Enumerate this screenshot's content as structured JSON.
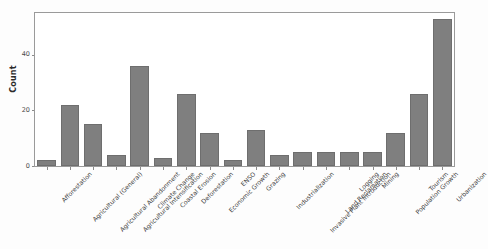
{
  "chart_data": {
    "type": "bar",
    "title": "",
    "xlabel": "",
    "ylabel": "Count",
    "ylim": [
      0,
      55
    ],
    "yticks": [
      0,
      20,
      40
    ],
    "ytick_labels": [
      "0",
      "20",
      "40"
    ],
    "grid": false,
    "legend": null,
    "bar_color": "#7f7f7f",
    "bar_edge_color": "#6e6e6e",
    "categories": [
      "Afforestation",
      "Agricultural (General)",
      "Agricultural Abandonment",
      "Agricultural Intensification",
      "Climate Change",
      "Coastal Erosion",
      "Deforestation",
      "Economic Growth",
      "ENSO",
      "Grazing",
      "Industrialization",
      "Invasive Plant Introduction",
      "Land Reclamation",
      "Logging",
      "Mining",
      "Population Growth",
      "Tourism",
      "Urbanization"
    ],
    "values": [
      2,
      22,
      15,
      4,
      36,
      3,
      26,
      12,
      2,
      13,
      4,
      5,
      5,
      5,
      5,
      12,
      26,
      53
    ]
  }
}
